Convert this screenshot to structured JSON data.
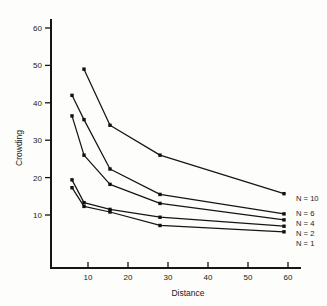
{
  "chart_data": {
    "type": "line",
    "title": "",
    "xlabel": "Distance",
    "ylabel": "Crowding",
    "xlim": [
      0,
      63
    ],
    "ylim": [
      0,
      64
    ],
    "xticks": [
      10,
      20,
      30,
      40,
      50,
      60
    ],
    "xtick_labels": [
      "10",
      "20",
      "30",
      "40",
      "50",
      "60"
    ],
    "yticks": [
      10,
      20,
      30,
      40,
      50,
      60
    ],
    "ytick_labels": [
      "10",
      "20",
      "30",
      "40",
      "50",
      "60"
    ],
    "grid": false,
    "legend_position": "right-inline-end-of-line",
    "markers": "filled-square",
    "series": [
      {
        "name": "N = 10",
        "label": "N = 10",
        "x": [
          9,
          15.5,
          28,
          59
        ],
        "values": [
          49,
          34,
          26,
          15.7
        ]
      },
      {
        "name": "N = 6",
        "label": "N = 6",
        "x": [
          6,
          9,
          15.5,
          28,
          59
        ],
        "values": [
          42,
          35.5,
          22.3,
          15.5,
          10.3
        ]
      },
      {
        "name": "N = 4",
        "label": "N = 4",
        "x": [
          6,
          9,
          15.5,
          28,
          59
        ],
        "values": [
          36.5,
          26,
          18.2,
          13.1,
          8.7
        ]
      },
      {
        "name": "N = 2",
        "label": "N = 2",
        "x": [
          6,
          9,
          15.5,
          28,
          59
        ],
        "values": [
          19.4,
          13.3,
          11.5,
          9.4,
          7.0
        ]
      },
      {
        "name": "N = 1",
        "label": "N = 1",
        "x": [
          6,
          9,
          15.5,
          28,
          59
        ],
        "values": [
          17.3,
          12.3,
          10.8,
          7.2,
          5.5
        ]
      }
    ]
  },
  "axes": {
    "x_title": "Distance",
    "y_title": "Crowding",
    "x_tick_0": "10",
    "x_tick_1": "20",
    "x_tick_2": "30",
    "x_tick_3": "40",
    "x_tick_4": "50",
    "x_tick_5": "60",
    "y_tick_0": "10",
    "y_tick_1": "20",
    "y_tick_2": "30",
    "y_tick_3": "40",
    "y_tick_4": "50",
    "y_tick_5": "60"
  },
  "legend": {
    "n10": "N = 10",
    "n6": "N = 6",
    "n4": "N = 4",
    "n2": "N = 2",
    "n1": "N = 1"
  },
  "colors": {
    "ink": "#151515",
    "background": "#fdfdfb"
  }
}
